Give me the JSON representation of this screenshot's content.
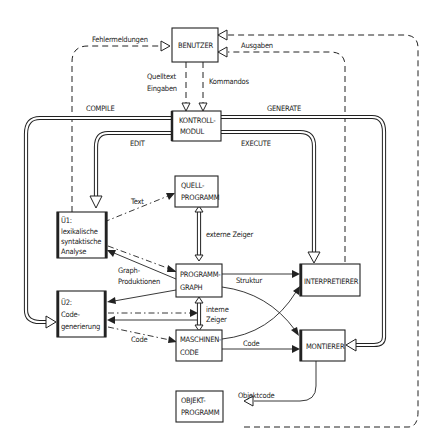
{
  "diagram": {
    "nodes": {
      "benutzer": {
        "lines": [
          "BENUTZER"
        ]
      },
      "kontrollmodul": {
        "lines": [
          "KONTROLL-",
          "MODUL"
        ]
      },
      "quellprogramm": {
        "lines": [
          "QUELL-",
          "PROGRAMM"
        ]
      },
      "u1": {
        "lines": [
          "Ü1:",
          "lexikalische",
          "syntaktische",
          "Analyse"
        ]
      },
      "programmgraph": {
        "lines": [
          "PROGRAMM-",
          "GRAPH"
        ]
      },
      "u2": {
        "lines": [
          "Ü2:",
          "Code-",
          "generierung"
        ]
      },
      "maschinencode": {
        "lines": [
          "MASCHINEN-",
          "CODE"
        ]
      },
      "interpretierer": {
        "lines": [
          "INTERPRETIERER"
        ]
      },
      "montierer": {
        "lines": [
          "MONTIERER"
        ]
      },
      "objektprogramm": {
        "lines": [
          "OBJEKT-",
          "PROGRAMM"
        ]
      }
    },
    "edges": {
      "fehlermeldungen": "Fehlermeldungen",
      "ausgaben": "Ausgaben",
      "quelltext_1": "Quelltext",
      "quelltext_2": "Eingaben",
      "kommandos": "Kommandos",
      "compile": "COMPILE",
      "generate": "GENERATE",
      "edit": "EDIT",
      "execute": "EXECUTE",
      "text": "Text",
      "externe_zeiger": "externe  Zeiger",
      "graph_produktionen_1": "Graph-",
      "graph_produktionen_2": "Produktionen",
      "struktur": "Struktur",
      "interne_zeiger_1": "interne",
      "interne_zeiger_2": "Zeiger",
      "code_u2": "Code",
      "code_montierer": "Code",
      "objektcode": "Objektcode"
    }
  }
}
